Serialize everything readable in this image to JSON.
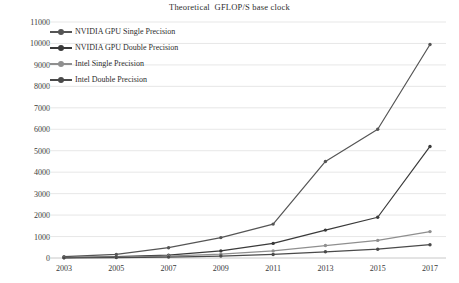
{
  "chart_data": {
    "type": "line",
    "title": "Theoretical  GFLOP/S base clock",
    "xlabel": "",
    "ylabel": "",
    "x": [
      2003,
      2005,
      2007,
      2009,
      2011,
      2013,
      2015,
      2017
    ],
    "categories": [
      "2003",
      "2005",
      "2007",
      "2009",
      "2011",
      "2013",
      "2015",
      "2017"
    ],
    "xlim": [
      2003,
      2017
    ],
    "ylim": [
      0,
      11000
    ],
    "yticks": [
      0,
      1000,
      2000,
      3000,
      4000,
      5000,
      6000,
      7000,
      8000,
      9000,
      10000,
      11000
    ],
    "ytick_labels": [
      "0",
      "1000",
      "2000",
      "3000",
      "4000",
      "5000",
      "6000",
      "7000",
      "8000",
      "9000",
      "10000",
      "11000"
    ],
    "grid": true,
    "legend_position": "upper-left-inside",
    "series": [
      {
        "name": "NVIDIA GPU Single Precision",
        "color": "#555555",
        "values": [
          60,
          170,
          480,
          950,
          1580,
          4500,
          6000,
          9950
        ]
      },
      {
        "name": "NVIDIA GPU Double Precision",
        "color": "#3a3a3a",
        "values": [
          20,
          60,
          130,
          330,
          680,
          1300,
          1900,
          5200
        ]
      },
      {
        "name": "Intel Single Precision",
        "color": "#8f8f8f",
        "values": [
          15,
          40,
          90,
          180,
          330,
          580,
          820,
          1230
        ]
      },
      {
        "name": "Intel Double Precision",
        "color": "#4a4a4a",
        "values": [
          8,
          20,
          45,
          90,
          165,
          290,
          410,
          620
        ]
      }
    ]
  }
}
